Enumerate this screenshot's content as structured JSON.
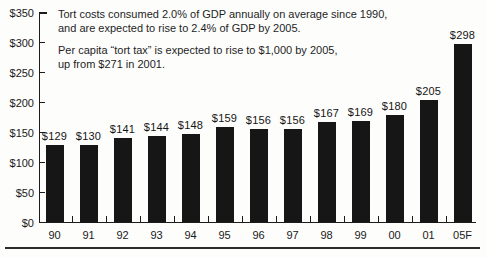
{
  "annotation": {
    "p1_lines": [
      "Tort costs consumed 2.0% of GDP annually on average since 1990,",
      "and are expected to rise to 2.4% of GDP by 2005."
    ],
    "p2_lines": [
      "Per capita “tort tax” is expected to rise to $1,000 by 2005,",
      "up from $271 in 2001."
    ]
  },
  "chart_data": {
    "type": "bar",
    "title": "",
    "xlabel": "",
    "ylabel": "",
    "categories": [
      "90",
      "91",
      "92",
      "93",
      "94",
      "95",
      "96",
      "97",
      "98",
      "99",
      "00",
      "01",
      "05F"
    ],
    "values": [
      129,
      130,
      141,
      144,
      148,
      159,
      156,
      156,
      167,
      169,
      180,
      205,
      298
    ],
    "bar_labels": [
      "$129",
      "$130",
      "$141",
      "$144",
      "$148",
      "$159",
      "$156",
      "$156",
      "$167",
      "$169",
      "$180",
      "$205",
      "$298"
    ],
    "ylim": [
      0,
      350
    ],
    "y_tick_values": [
      350,
      300,
      250,
      200,
      150,
      100,
      50,
      0
    ],
    "y_tick_labels": [
      "$350",
      "$300",
      "$250",
      "$200",
      "$150",
      "$100",
      "$50",
      "$0"
    ],
    "grid": false,
    "legend": "none",
    "bar_color": "#161616",
    "annotations": [
      "Tort costs consumed 2.0% of GDP annually on average since 1990, and are expected to rise to 2.4% of GDP by 2005.",
      "Per capita “tort tax” is expected to rise to $1,000 by 2005, up from $271 in 2001."
    ]
  }
}
